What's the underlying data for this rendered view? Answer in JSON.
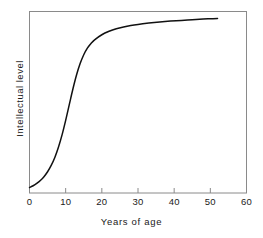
{
  "chart_data": {
    "type": "line",
    "title": "",
    "xlabel": "Years of age",
    "ylabel": "Intellectual level",
    "xlim": [
      0,
      60
    ],
    "ylim": [
      0,
      1
    ],
    "grid": false,
    "legend": null,
    "xticks": [
      "0",
      "10",
      "20",
      "30",
      "40",
      "50",
      "60"
    ],
    "xtick_values": [
      0,
      10,
      20,
      30,
      40,
      50,
      60
    ],
    "yticks": [],
    "ytick_values": [],
    "series": [
      {
        "name": "Intellectual level",
        "color": "#111111",
        "x": [
          0,
          1,
          2,
          3,
          4,
          5,
          6,
          7,
          8,
          9,
          10,
          11,
          12,
          13,
          14,
          15,
          16,
          17,
          18,
          20,
          22,
          24,
          26,
          28,
          30,
          33,
          36,
          39,
          42,
          45,
          48,
          50,
          52
        ],
        "y": [
          0.03,
          0.04,
          0.053,
          0.069,
          0.09,
          0.117,
          0.152,
          0.196,
          0.252,
          0.32,
          0.4,
          0.487,
          0.573,
          0.65,
          0.713,
          0.762,
          0.798,
          0.824,
          0.844,
          0.872,
          0.891,
          0.905,
          0.915,
          0.923,
          0.929,
          0.936,
          0.942,
          0.947,
          0.951,
          0.955,
          0.958,
          0.96,
          0.962
        ]
      }
    ],
    "annotations": []
  },
  "axes": {
    "frame_color": "#8a8a8a",
    "curve_color": "#111111",
    "background": "#ffffff"
  }
}
